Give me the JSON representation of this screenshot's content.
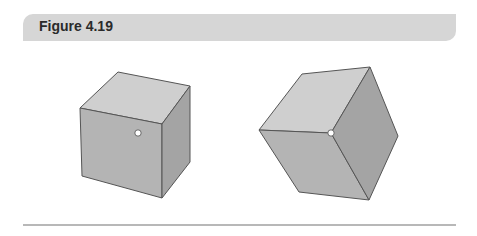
{
  "header": {
    "title": "Figure 4.19"
  },
  "figure": {
    "colors": {
      "top_face": "#cfcfcf",
      "front_face": "#b4b4b4",
      "side_face": "#a4a4a4",
      "edge": "#555555",
      "dot_fill": "#ffffff",
      "header_bg": "#d6d6d6",
      "rule": "#b8b8b8"
    },
    "cubes": [
      {
        "name": "left-cube",
        "view": "face-on with dot on front face"
      },
      {
        "name": "right-cube",
        "view": "corner-on with dot at central vertex"
      }
    ]
  }
}
